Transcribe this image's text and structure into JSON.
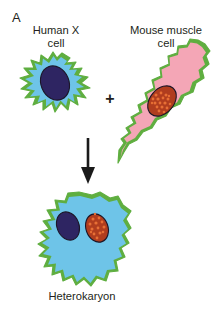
{
  "figure": {
    "panel_letter": "A",
    "background_color": "#ffffff",
    "caption_color": "#231f20",
    "operator": "+",
    "labels": {
      "human_cell_line1": "Human X",
      "human_cell_line2": "cell",
      "human_cell": "Human X\ncell",
      "mouse_cell_line1": "Mouse muscle",
      "mouse_cell_line2": "cell",
      "mouse_cell": "Mouse muscle\ncell",
      "result": "Heterokaryon"
    },
    "palette": {
      "membrane_green": "#5fae40",
      "human_cytoplasm_blue": "#6ec4e8",
      "human_nucleus_purple": "#2e2562",
      "mouse_cytoplasm_pink": "#f4a6b6",
      "mouse_nucleus_orange": "#b03d1e",
      "mouse_nucleus_speckle": "#e1682f",
      "arrow_black": "#1a1a1a",
      "nucleus_outline": "#1c1628"
    },
    "elements": {
      "human_cell": "irregular blue cell with green membrane and solid dark purple nucleus",
      "mouse_cell": "elongated diagonal pink spindle cell with green membrane and speckled orange nucleus",
      "fusion_arrow": "downward arrow",
      "heterokaryon_cell": "blue cell with green membrane containing both a purple human nucleus and a speckled orange mouse nucleus"
    }
  }
}
